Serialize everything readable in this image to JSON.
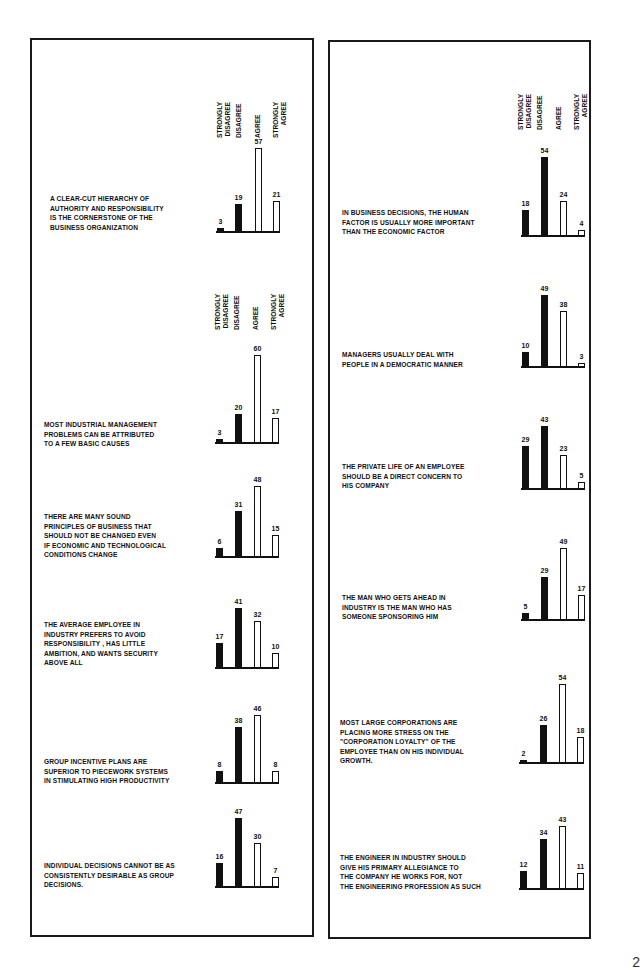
{
  "page": {
    "page_number_partial": "2"
  },
  "scale_labels": [
    "STRONGLY\nDISAGREE",
    "DISAGREE",
    "AGREE",
    "STRONGLY\nAGREE"
  ],
  "chart_data": {
    "type": "bar",
    "title": "",
    "xlabel": "",
    "ylabel": "Percent of respondents",
    "categories": [
      "Strongly Disagree",
      "Disagree",
      "Agree",
      "Strongly Agree"
    ],
    "legend": "Dark bars = disagree responses; white bars = agree responses",
    "grid": false,
    "charts": [
      {
        "panel": "left",
        "statement": "A CLEAR-CUT HIERARCHY OF\nAUTHORITY AND  RESPONSIBILITY\nIS THE CORNERSTONE OF  THE\nBUSINESS ORGANIZATION",
        "values": [
          3,
          19,
          57,
          21
        ]
      },
      {
        "panel": "left",
        "statement": "MOST INDUSTRIAL MANAGEMENT\nPROBLEMS CAN BE ATTRIBUTED\nTO A FEW BASIC CAUSES",
        "values": [
          3,
          20,
          60,
          17
        ]
      },
      {
        "panel": "left",
        "statement": "THERE ARE MANY SOUND\nPRINCIPLES OF BUSINESS THAT\nSHOULD NOT BE CHANGED EVEN\nIF ECONOMIC AND TECHNOLOGICAL\nCONDITIONS CHANGE",
        "values": [
          6,
          31,
          48,
          15
        ]
      },
      {
        "panel": "left",
        "statement": "THE AVERAGE EMPLOYEE IN\nINDUSTRY PREFERS TO AVOID\nRESPONSIBILITY , HAS LITTLE\nAMBITION, AND WANTS SECURITY\nABOVE ALL",
        "values": [
          17,
          41,
          32,
          10
        ]
      },
      {
        "panel": "left",
        "statement": "GROUP INCENTIVE PLANS ARE\nSUPERIOR TO PIECEWORK SYSTEMS\nIN STIMULATING  HIGH PRODUCTIVITY",
        "values": [
          8,
          38,
          46,
          8
        ]
      },
      {
        "panel": "left",
        "statement": "INDIVIDUAL DECISIONS CANNOT BE AS\nCONSISTENTLY DESIRABLE AS GROUP\nDECISIONS.",
        "values": [
          16,
          47,
          30,
          7
        ]
      },
      {
        "panel": "right",
        "statement": "IN BUSINESS DECISIONS, THE HUMAN\nFACTOR IS USUALLY MORE IMPORTANT\nTHAN THE ECONOMIC FACTOR",
        "values": [
          18,
          54,
          24,
          4
        ]
      },
      {
        "panel": "right",
        "statement": "MANAGERS USUALLY DEAL WITH\nPEOPLE IN  A DEMOCRATIC MANNER",
        "values": [
          10,
          49,
          38,
          3
        ]
      },
      {
        "panel": "right",
        "statement": "THE PRIVATE LIFE OF AN EMPLOYEE\nSHOULD  BE A DIRECT CONCERN TO\nHIS COMPANY",
        "values": [
          29,
          43,
          23,
          5
        ]
      },
      {
        "panel": "right",
        "statement": "THE MAN WHO GETS AHEAD IN\nINDUSTRY  IS THE MAN WHO HAS\nSOMEONE SPONSORING  HIM",
        "values": [
          5,
          29,
          49,
          17
        ]
      },
      {
        "panel": "right",
        "statement": "MOST LARGE CORPORATIONS ARE\nPLACING  MORE  STRESS  ON THE\n\"CORPORATION LOYALTY\" OF THE\nEMPLOYEE THAN ON HIS INDIVIDUAL\nGROWTH.",
        "values": [
          2,
          26,
          54,
          18
        ]
      },
      {
        "panel": "right",
        "statement": "THE ENGINEER IN INDUSTRY SHOULD\nGIVE HIS PRIMARY ALLEGIANCE  TO\nTHE  COMPANY  HE WORKS FOR, NOT\nTHE ENGINEERING PROFESSION  AS SUCH",
        "values": [
          12,
          34,
          43,
          11
        ]
      }
    ],
    "colors": {
      "disagree_fill": "#111111",
      "agree_fill": "#ffffff",
      "outline": "#111111"
    }
  }
}
